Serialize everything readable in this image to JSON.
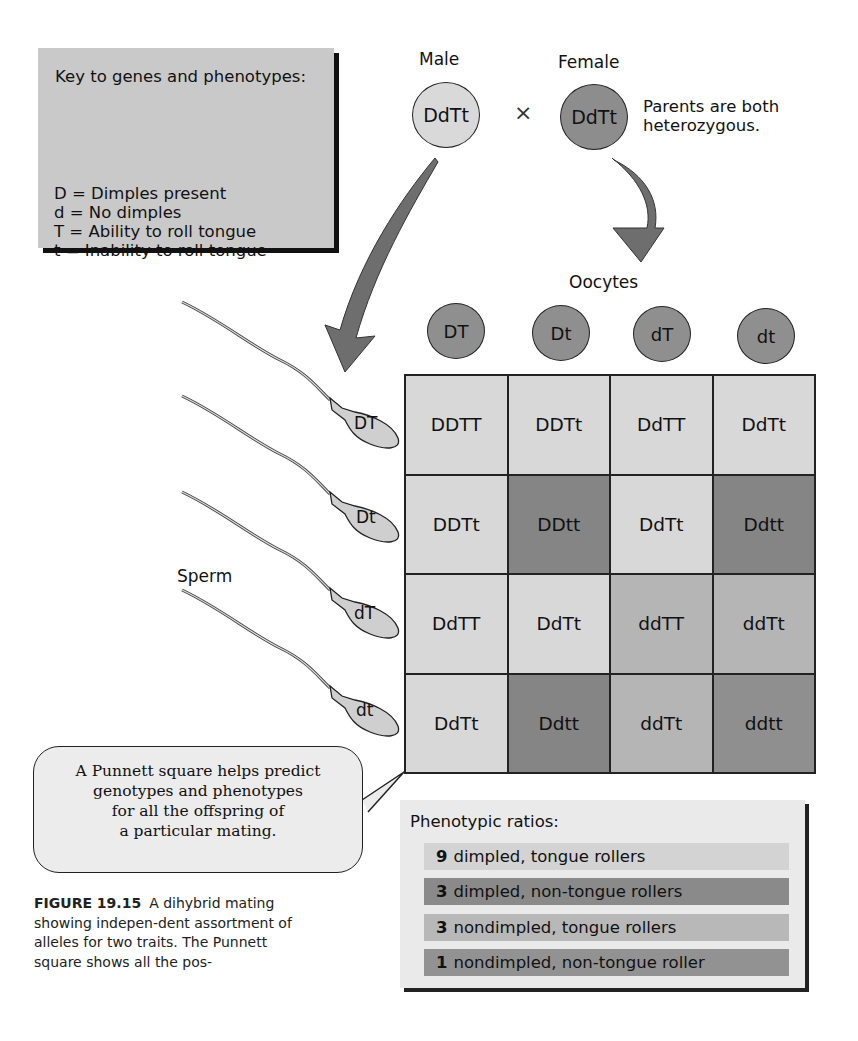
{
  "key": {
    "title": "Key to genes and phenotypes:",
    "items": [
      "D = Dimples present",
      "d = No dimples",
      "T = Ability to roll tongue",
      "t  = Inability to roll tongue"
    ]
  },
  "parents": {
    "male_label": "Male",
    "female_label": "Female",
    "male_genotype": "DdTt",
    "female_genotype": "DdTt",
    "cross_symbol": "×",
    "note_line1": "Parents are both",
    "note_line2": "heterozygous."
  },
  "oocytes": {
    "label": "Oocytes",
    "gametes": [
      "DT",
      "Dt",
      "dT",
      "dt"
    ]
  },
  "sperm": {
    "label": "Sperm",
    "gametes": [
      "DT",
      "Dt",
      "dT",
      "dt"
    ]
  },
  "punnett": {
    "rows": [
      [
        "DDTT",
        "DDTt",
        "DdTT",
        "DdTt"
      ],
      [
        "DDTt",
        "DDtt",
        "DdTt",
        "Ddtt"
      ],
      [
        "DdTT",
        "DdTt",
        "ddTT",
        "ddTt"
      ],
      [
        "DdTt",
        "Ddtt",
        "ddTt",
        "ddtt"
      ]
    ]
  },
  "colors": {
    "dimpled_roller": "#d8d8d8",
    "dimpled_nonroller": "#858585",
    "nondimpled_roller": "#b5b5b5",
    "nondimpled_nonroller": "#8f8f8f",
    "key_bg": "#c9c9c9"
  },
  "callout": {
    "line1": "A Punnett square helps predict",
    "line2": "genotypes and phenotypes",
    "line3": "for all the offspring of",
    "line4": "a particular mating."
  },
  "phenotypic_ratios": {
    "title": "Phenotypic ratios:",
    "rows": [
      {
        "count": "9",
        "text": "dimpled, tongue rollers"
      },
      {
        "count": "3",
        "text": "dimpled, non-tongue rollers"
      },
      {
        "count": "3",
        "text": "nondimpled, tongue rollers"
      },
      {
        "count": "1",
        "text": "nondimpled, non-tongue roller"
      }
    ]
  },
  "caption": {
    "figure_number": "FIGURE 19.15",
    "text": "A dihybrid mating showing indepen-dent assortment of alleles for two traits. The Punnett square shows all the pos-"
  }
}
